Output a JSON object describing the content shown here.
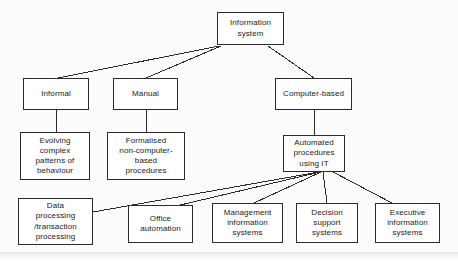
{
  "diagram": {
    "type": "hierarchy-tree",
    "style": {
      "background": "#fcfcfc",
      "box_fill": "#ffffff",
      "box_stroke": "#2b2b2b",
      "text_color": "#1a1a1a",
      "line_color": "#2b2b2b"
    },
    "nodes": [
      {
        "id": "information-system",
        "label": "Information\nsystem",
        "x": 217,
        "y": 12,
        "w": 67,
        "h": 33,
        "level": 0
      },
      {
        "id": "informal",
        "label": "Informal",
        "x": 23,
        "y": 78,
        "w": 66,
        "h": 32,
        "level": 1
      },
      {
        "id": "manual",
        "label": "Manual",
        "x": 113,
        "y": 78,
        "w": 65,
        "h": 32,
        "level": 1
      },
      {
        "id": "computer-based",
        "label": "Computer-based",
        "x": 275,
        "y": 78,
        "w": 77,
        "h": 32,
        "level": 1
      },
      {
        "id": "evolving-complex-patterns-of-behaviour",
        "label": "Evolving\ncomplex\npatterns of\nbehaviour",
        "x": 20,
        "y": 132,
        "w": 70,
        "h": 48,
        "level": 2
      },
      {
        "id": "formalised-non-computer-based-procedures",
        "label": "Formalised\nnon-computer-\nbased\nprocedures",
        "x": 107,
        "y": 132,
        "w": 78,
        "h": 48,
        "level": 2
      },
      {
        "id": "automated-procedures-using-it",
        "label": "Automated\nprocedures\nusing IT",
        "x": 283,
        "y": 135,
        "w": 62,
        "h": 37,
        "level": 2
      },
      {
        "id": "data-processing-transaction-processing",
        "label": "Data\nprocessing\n/transaction\nprocessing",
        "x": 18,
        "y": 198,
        "w": 75,
        "h": 47,
        "level": 3
      },
      {
        "id": "office-automation",
        "label": "Office\nautomation",
        "x": 128,
        "y": 205,
        "w": 65,
        "h": 38,
        "level": 3
      },
      {
        "id": "management-information-systems",
        "label": "Management\ninformation\nsystems",
        "x": 212,
        "y": 203,
        "w": 71,
        "h": 40,
        "level": 3
      },
      {
        "id": "decision-support-systems",
        "label": "Decision\nsupport\nsystems",
        "x": 296,
        "y": 203,
        "w": 62,
        "h": 40,
        "level": 3
      },
      {
        "id": "executive-information-systems",
        "label": "Executive\ninformation\nsystems",
        "x": 375,
        "y": 203,
        "w": 65,
        "h": 40,
        "level": 3
      }
    ],
    "edges": [
      {
        "from": "information-system",
        "to": "informal",
        "x1": 219,
        "y1": 46,
        "x2": 58,
        "y2": 78
      },
      {
        "from": "information-system",
        "to": "manual",
        "x1": 221,
        "y1": 46,
        "x2": 146,
        "y2": 78
      },
      {
        "from": "information-system",
        "to": "computer-based",
        "x1": 268,
        "y1": 46,
        "x2": 314,
        "y2": 78
      },
      {
        "from": "informal",
        "to": "evolving-complex-patterns-of-behaviour",
        "x1": 56,
        "y1": 110,
        "x2": 56,
        "y2": 132
      },
      {
        "from": "manual",
        "to": "formalised-non-computer-based-procedures",
        "x1": 146,
        "y1": 110,
        "x2": 146,
        "y2": 132
      },
      {
        "from": "computer-based",
        "to": "automated-procedures-using-it",
        "x1": 314,
        "y1": 110,
        "x2": 314,
        "y2": 135
      },
      {
        "from": "automated-procedures-using-it",
        "to": "data-processing-transaction-processing",
        "x1": 319,
        "y1": 172,
        "x2": 93,
        "y2": 212
      },
      {
        "from": "automated-procedures-using-it",
        "to": "office-automation",
        "x1": 320,
        "y1": 172,
        "x2": 176,
        "y2": 206
      },
      {
        "from": "automated-procedures-using-it",
        "to": "management-information-systems",
        "x1": 321,
        "y1": 172,
        "x2": 254,
        "y2": 203
      },
      {
        "from": "automated-procedures-using-it",
        "to": "decision-support-systems",
        "x1": 323,
        "y1": 172,
        "x2": 327,
        "y2": 203
      },
      {
        "from": "automated-procedures-using-it",
        "to": "executive-information-systems",
        "x1": 333,
        "y1": 172,
        "x2": 392,
        "y2": 203
      }
    ]
  }
}
